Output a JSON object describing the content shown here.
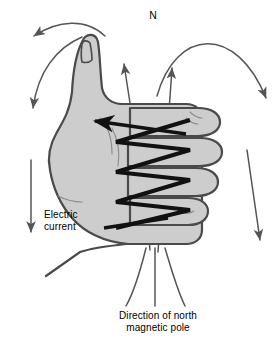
{
  "diagram": {
    "type": "physics-illustration",
    "background_color": "#ffffff",
    "labels": {
      "north_marker": "N",
      "electric_current": "Electric\ncurrent",
      "north_pole_direction": "Direction of north\nmagnetic pole"
    },
    "colors": {
      "hand_fill": "#cdcdcd",
      "hand_outline": "#4a4a4a",
      "crease_line": "#8a8a8a",
      "field_line": "#555555",
      "coil_wire": "#111111",
      "text": "#000000"
    },
    "elements": {
      "hand": {
        "name": "right-hand",
        "description": "Right hand with thumb extended upward and four fingers curled",
        "thumb_direction": "up",
        "fingers_count": 4,
        "fingers_curl": "toward viewer-left"
      },
      "coil": {
        "name": "current-coil",
        "description": "Bold zigzag wire wound around the curled fingers",
        "turns": 5,
        "arrow_direction": "left",
        "stroke_width": 4
      },
      "field_lines": {
        "name": "magnetic-field-lines",
        "count": 7,
        "description": "Field lines emerge from the thumb side, arc over the top and descend on both sides",
        "arrow_directions": [
          "down-left",
          "down-left",
          "up-right",
          "up-right",
          "down-right",
          "down",
          "down"
        ]
      },
      "pole_lines": {
        "name": "north-pole-indicator-lines",
        "count": 3,
        "description": "Three lines splaying downward below the wrist toward the caption"
      }
    }
  }
}
